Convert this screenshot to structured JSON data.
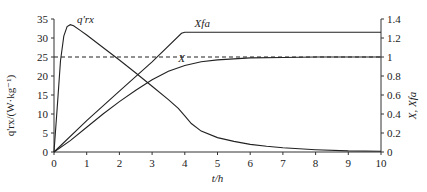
{
  "chart_data": {
    "type": "line",
    "title": "",
    "xlabel": "t/h",
    "ylabel_left": "q'rx/(W·kg⁻¹)",
    "ylabel_right": "X, Xfa",
    "xlim": [
      0,
      10
    ],
    "ylim_left": [
      0,
      35
    ],
    "ylim_right": [
      0,
      1.4
    ],
    "x_ticks": [
      "0",
      "1",
      "2",
      "3",
      "4",
      "5",
      "6",
      "7",
      "8",
      "9",
      "10"
    ],
    "y_ticks_left": [
      "0",
      "5",
      "10",
      "15",
      "20",
      "25",
      "30",
      "35"
    ],
    "y_ticks_right": [
      "0",
      "0.2",
      "0.4",
      "0.6",
      "0.8",
      "1",
      "1.2",
      "1.4"
    ],
    "grid": false,
    "legend": "inline labels",
    "series": [
      {
        "name": "q'rx",
        "axis": "left",
        "style": "solid",
        "x": [
          0,
          0.1,
          0.2,
          0.3,
          0.4,
          0.5,
          0.6,
          0.8,
          1.0,
          1.5,
          2.0,
          2.5,
          3.0,
          3.5,
          3.8,
          4.0,
          4.2,
          4.5,
          5.0,
          5.5,
          6.0,
          6.5,
          7.0,
          8.0,
          9.0,
          10.0
        ],
        "values": [
          0,
          12,
          24,
          30.5,
          33,
          33.5,
          33.2,
          32,
          30.8,
          27.5,
          24.2,
          20.8,
          17.3,
          13.8,
          11.5,
          9.5,
          7.5,
          5.5,
          3.8,
          2.8,
          2.0,
          1.5,
          1.1,
          0.6,
          0.3,
          0.2
        ]
      },
      {
        "name": "Xfa",
        "axis": "right",
        "style": "solid",
        "x": [
          0,
          1,
          2,
          3,
          3.9,
          4.0,
          5,
          6,
          7,
          8,
          9,
          10
        ],
        "values": [
          0,
          0.33,
          0.64,
          0.95,
          1.25,
          1.26,
          1.26,
          1.26,
          1.26,
          1.26,
          1.26,
          1.26
        ]
      },
      {
        "name": "X",
        "axis": "right",
        "style": "solid",
        "x": [
          0,
          0.5,
          1,
          1.5,
          2,
          2.5,
          3,
          3.5,
          4,
          4.5,
          5,
          5.5,
          6,
          7,
          8,
          9,
          10
        ],
        "values": [
          0,
          0.12,
          0.26,
          0.4,
          0.53,
          0.65,
          0.76,
          0.85,
          0.91,
          0.95,
          0.97,
          0.98,
          0.99,
          0.995,
          1.0,
          1.0,
          1.0
        ]
      },
      {
        "name": "reference",
        "axis": "right",
        "style": "dashed",
        "x": [
          0,
          10
        ],
        "values": [
          1.0,
          1.0
        ]
      }
    ],
    "annotations": [
      {
        "text": "q'rx",
        "x": 0.7,
        "y_left": 34
      },
      {
        "text": "Xfa",
        "x": 4.3,
        "y_right": 1.32
      },
      {
        "text": "X",
        "x": 3.8,
        "y_right": 0.95
      }
    ]
  },
  "labels": {
    "xlabel": "t/h",
    "ylabel_left": "q'rx/(W·kg⁻¹)",
    "ylabel_right": "X, Xfa",
    "curve_q": "q'rx",
    "curve_xfa": "Xfa",
    "curve_x": "X"
  }
}
